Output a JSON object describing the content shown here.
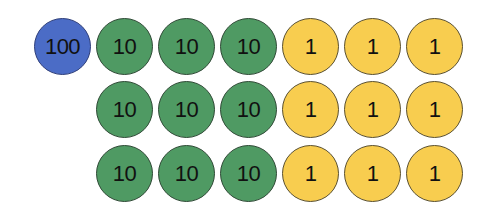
{
  "colors": {
    "hundreds": "#4b6cc6",
    "tens": "#4f9a63",
    "ones": "#f8cd4f"
  },
  "rows": [
    {
      "discs": [
        "100",
        "10",
        "10",
        "10",
        "1",
        "1",
        "1"
      ]
    },
    {
      "discs": [
        "10",
        "10",
        "10",
        "1",
        "1",
        "1"
      ]
    },
    {
      "discs": [
        "10",
        "10",
        "10",
        "1",
        "1",
        "1"
      ]
    }
  ]
}
